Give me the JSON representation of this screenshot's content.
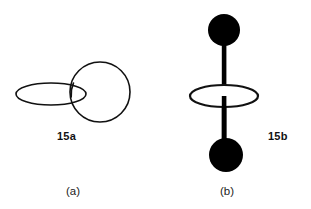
{
  "figure": {
    "background_color": "#ffffff",
    "stroke_color": "#111111",
    "fill_color": "#000000",
    "panels": [
      {
        "id": "a",
        "caption": "(a)",
        "structure_label": "15a",
        "description": "outline circle interlocked with outline ellipse",
        "shapes": {
          "circle": {
            "cx": 100,
            "cy": 92,
            "r": 30,
            "stroke_width": 1.6,
            "fill": "none"
          },
          "ellipse": {
            "cx": 51,
            "cy": 94,
            "rx": 35,
            "ry": 11,
            "stroke_width": 1.6,
            "fill": "none"
          }
        }
      },
      {
        "id": "b",
        "caption": "(b)",
        "structure_label": "15b",
        "description": "filled dumbbell axle threaded through an outline ellipse",
        "shapes": {
          "top_disc": {
            "cx": 69,
            "cy": 30,
            "r": 16,
            "fill": "#000000"
          },
          "bottom_disc": {
            "cx": 71,
            "cy": 155,
            "r": 17,
            "fill": "#000000"
          },
          "rod": {
            "x": 67,
            "y_top": 30,
            "y_bottom": 155,
            "width": 4.5,
            "fill": "#000000"
          },
          "ellipse": {
            "cx": 69,
            "cy": 96,
            "rx": 34,
            "ry": 11,
            "stroke_width": 2.2,
            "fill": "#ffffff"
          }
        }
      }
    ]
  }
}
